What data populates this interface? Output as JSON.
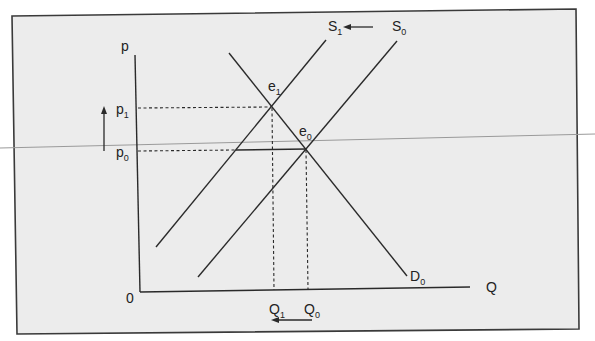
{
  "diagram": {
    "type": "supply-demand",
    "title": "",
    "axes": {
      "y_label": "p",
      "x_label": "Q",
      "origin_label": "0"
    },
    "price_levels": [
      {
        "id": "p1",
        "base": "p",
        "sub": "1"
      },
      {
        "id": "p0",
        "base": "p",
        "sub": "0"
      }
    ],
    "quantity_levels": [
      {
        "id": "Q1",
        "base": "Q",
        "sub": "1"
      },
      {
        "id": "Q0",
        "base": "Q",
        "sub": "0"
      }
    ],
    "curves": {
      "supply_new": {
        "base": "S",
        "sub": "1"
      },
      "supply_old": {
        "base": "S",
        "sub": "0"
      },
      "demand": {
        "base": "D",
        "sub": "0"
      }
    },
    "equilibria": {
      "e1": {
        "base": "e",
        "sub": "1"
      },
      "e0": {
        "base": "e",
        "sub": "0"
      }
    },
    "annotations": {
      "price_arrow": "up",
      "quantity_arrow": "left",
      "supply_shift_arrow": "left"
    },
    "colors": {
      "background": "#ececec",
      "frame": "#3a3a3a",
      "ink": "#2a2a2a",
      "scan_line": "#9a9a9a"
    }
  }
}
